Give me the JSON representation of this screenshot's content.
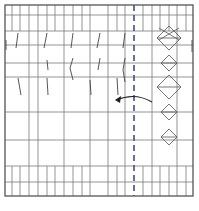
{
  "diagram": {
    "type": "origami-crease-pattern",
    "width": 199,
    "height": 211,
    "colors": {
      "grid": "#7a7a7a",
      "border": "#555555",
      "crease": "#444444",
      "fold_line": "#3d4f8a",
      "arrow": "#222222",
      "background": "#ffffff"
    },
    "border": {
      "x": 5,
      "y": 5,
      "w": 188,
      "h": 191
    },
    "fold_line": {
      "x": 134,
      "y1": 5,
      "y2": 196,
      "style": "dashed"
    },
    "vertical_lines": [
      12,
      20,
      29,
      38,
      47,
      55,
      64,
      73,
      82,
      90,
      108,
      117,
      125,
      143,
      152,
      160,
      169,
      177,
      186
    ],
    "full_vertical_lines": [
      29,
      38,
      64,
      90,
      108,
      125,
      152,
      177
    ],
    "horizontal_lines": [
      15,
      31,
      45,
      63,
      77,
      112,
      140,
      166,
      182
    ],
    "top_strip_bottom": 31,
    "bottom_strip_top": 166,
    "diamonds": [
      {
        "cx": 169,
        "cy": 38,
        "rx": 12,
        "ry": 12
      },
      {
        "cx": 169,
        "cy": 63,
        "rx": 8,
        "ry": 8
      },
      {
        "cx": 169,
        "cy": 87,
        "rx": 12,
        "ry": 12
      },
      {
        "cx": 169,
        "cy": 112,
        "rx": 8,
        "ry": 8
      },
      {
        "cx": 169,
        "cy": 137,
        "rx": 8,
        "ry": 8
      }
    ],
    "crease_marks": [
      {
        "x1": 18,
        "y1": 33,
        "x2": 16,
        "y2": 48
      },
      {
        "x1": 47,
        "y1": 33,
        "x2": 44,
        "y2": 48
      },
      {
        "x1": 47,
        "y1": 60,
        "x2": 48,
        "y2": 70
      },
      {
        "x1": 73,
        "y1": 33,
        "x2": 71,
        "y2": 48
      },
      {
        "x1": 73,
        "y1": 58,
        "x2": 70,
        "y2": 68
      },
      {
        "x1": 70,
        "y1": 68,
        "x2": 73,
        "y2": 80
      },
      {
        "x1": 100,
        "y1": 33,
        "x2": 97,
        "y2": 48
      },
      {
        "x1": 100,
        "y1": 58,
        "x2": 98,
        "y2": 70
      },
      {
        "x1": 125,
        "y1": 33,
        "x2": 123,
        "y2": 48
      },
      {
        "x1": 125,
        "y1": 58,
        "x2": 123,
        "y2": 70
      },
      {
        "x1": 123,
        "y1": 70,
        "x2": 125,
        "y2": 82
      },
      {
        "x1": 18,
        "y1": 78,
        "x2": 21,
        "y2": 95
      },
      {
        "x1": 47,
        "y1": 78,
        "x2": 48,
        "y2": 95
      },
      {
        "x1": 90,
        "y1": 80,
        "x2": 91,
        "y2": 95
      },
      {
        "x1": 117,
        "y1": 78,
        "x2": 118,
        "y2": 95
      },
      {
        "x1": 6,
        "y1": 40,
        "x2": 6,
        "y2": 50
      },
      {
        "x1": 192,
        "y1": 40,
        "x2": 192,
        "y2": 52
      }
    ],
    "arrow": {
      "path": "M 152 102 Q 135 92 116 100",
      "head": {
        "x": 115,
        "y": 100
      },
      "direction": "left"
    }
  }
}
